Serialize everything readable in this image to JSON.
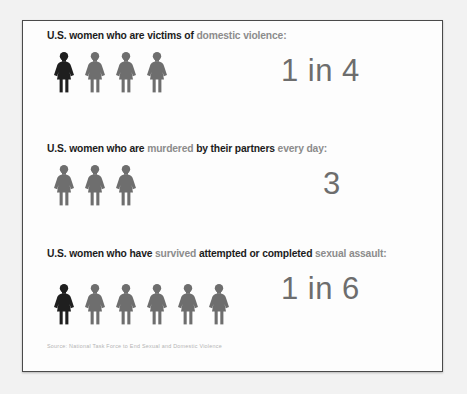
{
  "poster": {
    "background_color": "#f2f2f2",
    "page_color": "#fdfdfd",
    "border_color": "#4a4a4a",
    "highlight_color": "#1f1f1f",
    "figure_color": "#6e6e6e",
    "headline_color": "#1c1c1c",
    "headline_soft_color": "#8c8c8c",
    "bignum_color": "#6d6d6d"
  },
  "stats": [
    {
      "headline_parts": [
        {
          "text": "U.S. women who are victims of ",
          "emphasis": "strong"
        },
        {
          "text": "domestic violence:",
          "emphasis": "soft"
        }
      ],
      "icon_name": "female-figure-icon",
      "figure_total": 4,
      "figure_highlighted": 1,
      "value": "1 in 4"
    },
    {
      "headline_parts": [
        {
          "text": "U.S. women who are ",
          "emphasis": "strong"
        },
        {
          "text": "murdered ",
          "emphasis": "soft"
        },
        {
          "text": "by their partners ",
          "emphasis": "strong"
        },
        {
          "text": "every day:",
          "emphasis": "soft"
        }
      ],
      "icon_name": "female-figure-icon",
      "figure_total": 3,
      "figure_highlighted": 0,
      "value": "3"
    },
    {
      "headline_parts": [
        {
          "text": "U.S. women who have ",
          "emphasis": "strong"
        },
        {
          "text": "survived ",
          "emphasis": "soft"
        },
        {
          "text": "attempted or completed ",
          "emphasis": "strong"
        },
        {
          "text": "sexual assault:",
          "emphasis": "soft"
        }
      ],
      "icon_name": "female-figure-icon",
      "figure_total": 6,
      "figure_highlighted": 1,
      "value": "1 in 6"
    }
  ],
  "source": {
    "text": "Source: National Task Force to End Sexual and Domestic Violence"
  },
  "chart_data": {
    "type": "pictogram",
    "unit_icon": "female-figure-icon",
    "series": [
      {
        "label": "U.S. women who are victims of domestic violence",
        "icons_total": 4,
        "icons_highlighted": 1,
        "value_text": "1 in 4",
        "ratio": 0.25
      },
      {
        "label": "U.S. women who are murdered by their partners every day",
        "icons_total": 3,
        "icons_highlighted": 0,
        "value_text": "3",
        "ratio": null
      },
      {
        "label": "U.S. women who have survived attempted or completed sexual assault",
        "icons_total": 6,
        "icons_highlighted": 1,
        "value_text": "1 in 6",
        "ratio": 0.1667
      }
    ],
    "source": "Source: National Task Force to End Sexual and Domestic Violence"
  }
}
